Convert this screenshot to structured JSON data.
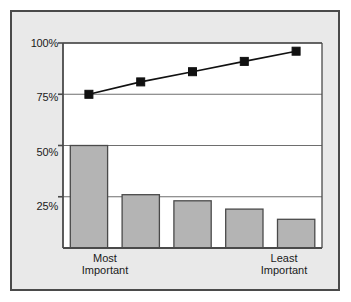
{
  "chart_data": {
    "type": "bar",
    "title": "",
    "subtitle": "",
    "xlabel": "",
    "ylabel": "",
    "ylim": [
      0,
      100
    ],
    "grid": true,
    "legend": "none",
    "categories": [
      "1",
      "2",
      "3",
      "4",
      "5"
    ],
    "axis_tick_labels": {
      "y": [
        "100%",
        "75%",
        "50%",
        "25%"
      ],
      "y_values": [
        100,
        75,
        50,
        25
      ],
      "x_left": "Most\nImportant",
      "x_right": "Least\nImportant"
    },
    "series": [
      {
        "name": "Response share",
        "type": "bar",
        "values": [
          50,
          26,
          23,
          19,
          14
        ]
      },
      {
        "name": "Cumulative",
        "type": "line",
        "values": [
          75,
          81,
          86,
          91,
          96
        ]
      }
    ],
    "colors": {
      "bar_fill": "#b4b4b4",
      "bar_stroke": "#4a4a4a",
      "line": "#111111",
      "marker": "#111111",
      "grid": "#6e6e6e",
      "axis": "#4a4a4a",
      "plot_bg": "#ffffff",
      "frame_bg": "#e9e9e9",
      "frame_border": "#4a4a4a",
      "text": "#1a1a1a"
    }
  },
  "axis_labels": {
    "y": [
      {
        "text": "100%"
      },
      {
        "text": "75%"
      },
      {
        "text": "50%"
      },
      {
        "text": "25%"
      }
    ],
    "x_left": {
      "line1": "Most",
      "line2": "Important"
    },
    "x_right": {
      "line1": "Least",
      "line2": "Important"
    }
  }
}
